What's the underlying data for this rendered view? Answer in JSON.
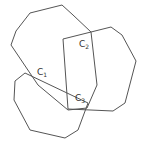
{
  "diagram": {
    "stroke_color": "#555555",
    "background": "#ffffff",
    "polygons": [
      {
        "name": "top-polygon",
        "points": "30,13 62,5 73,15 91,32 97,85 87,108 68,110 38,85 11,45 16,31"
      },
      {
        "name": "right-polygon",
        "points": "63,39 111,27 122,35 136,61 125,103 113,111 68,109"
      },
      {
        "name": "bottom-left-polygon",
        "points": "25,73 15,81 14,100 30,130 65,138 78,130 88,103"
      }
    ],
    "labels": [
      {
        "main": "C",
        "sub": "2",
        "x": 79,
        "y": 47
      },
      {
        "main": "C",
        "sub": "1",
        "x": 37,
        "y": 75
      },
      {
        "main": "C",
        "sub": "3",
        "x": 75,
        "y": 101
      }
    ]
  }
}
